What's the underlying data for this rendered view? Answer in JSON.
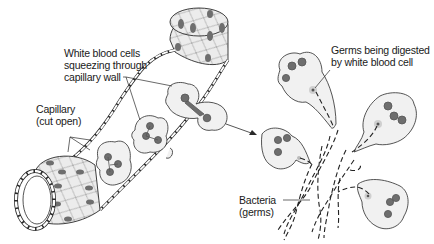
{
  "figure": {
    "type": "biology-illustration"
  },
  "labels": {
    "white_blood_cells": {
      "line1": "White blood cells",
      "line2": "squeezing through",
      "line3": "capillary wall"
    },
    "capillary": {
      "line1": "Capillary",
      "line2": "(cut open)"
    },
    "germs_digested": {
      "line1": "Germs being digested",
      "line2": "by white blood cell"
    },
    "bacteria": {
      "line1": "Bacteria",
      "line2": "(germs)"
    }
  },
  "colors": {
    "line": "#2a2a2a",
    "cell_fill": "#f1f1f1",
    "nucleus": "#6e6e6e",
    "capillary_fill": "#e9e9e9",
    "background": "#ffffff"
  }
}
